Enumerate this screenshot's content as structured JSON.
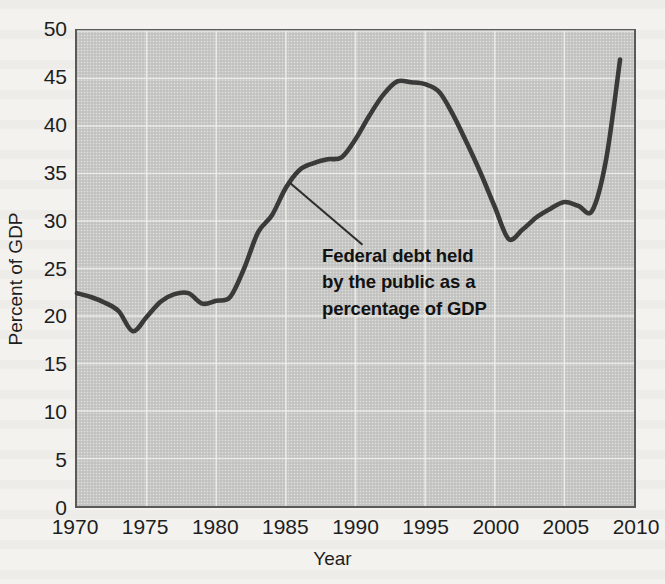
{
  "figure": {
    "background_color": "#f3f2ef",
    "plot_background_color": "#c9c9c7",
    "gridline_color": "#ffffff",
    "line_color": "#3a3a3a",
    "text_color": "#1e1e1e"
  },
  "axes": {
    "y_title": "Percent of GDP",
    "x_title": "Year",
    "y_ticks": [
      "0",
      "5",
      "10",
      "15",
      "20",
      "25",
      "30",
      "35",
      "40",
      "45",
      "50"
    ],
    "x_ticks": [
      "1970",
      "1975",
      "1980",
      "1985",
      "1990",
      "1995",
      "2000",
      "2005",
      "2010"
    ]
  },
  "annotation": {
    "line1": "Federal debt held",
    "line2": "by the public as a",
    "line3": "percentage of GDP"
  },
  "chart_data": {
    "type": "line",
    "title": "",
    "subtitle": "",
    "xlabel": "Year",
    "ylabel": "Percent of GDP",
    "xlim": [
      1970,
      2010
    ],
    "ylim": [
      0,
      50
    ],
    "xticks": [
      1970,
      1975,
      1980,
      1985,
      1990,
      1995,
      2000,
      2005,
      2010
    ],
    "yticks": [
      0,
      5,
      10,
      15,
      20,
      25,
      30,
      35,
      40,
      45,
      50
    ],
    "grid": true,
    "legend": "none",
    "annotations": [
      {
        "text": "Federal debt held by the public as a percentage of GDP",
        "points_to_x": 1985.3,
        "points_to_y": 34.0,
        "text_x": 1990.5,
        "text_y": 27.5
      }
    ],
    "series": [
      {
        "name": "Federal debt held by the public as a percentage of GDP",
        "color": "#3a3a3a",
        "x": [
          1970,
          1971,
          1972,
          1973,
          1974,
          1975,
          1976,
          1977,
          1978,
          1979,
          1980,
          1981,
          1982,
          1983,
          1984,
          1985,
          1986,
          1987,
          1988,
          1989,
          1990,
          1991,
          1992,
          1993,
          1994,
          1995,
          1996,
          1997,
          1998,
          1999,
          2000,
          2001,
          2002,
          2003,
          2004,
          2005,
          2006,
          2007,
          2008,
          2009
        ],
        "y": [
          22.4,
          22.0,
          21.4,
          20.5,
          18.4,
          19.9,
          21.5,
          22.3,
          22.4,
          21.3,
          21.6,
          22.0,
          25.0,
          28.8,
          30.6,
          33.5,
          35.4,
          36.1,
          36.5,
          36.7,
          38.6,
          41.1,
          43.3,
          44.7,
          44.6,
          44.4,
          43.6,
          41.2,
          38.2,
          35.0,
          31.5,
          28.1,
          29.1,
          30.4,
          31.3,
          32.0,
          31.6,
          31.1,
          36.5,
          47.0
        ]
      }
    ]
  }
}
